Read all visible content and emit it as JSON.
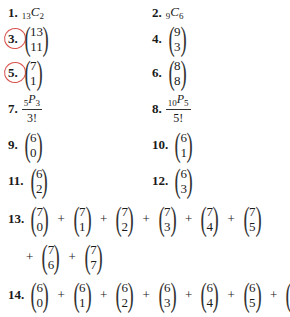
{
  "problems": [
    {
      "n": "1.",
      "type": "comb",
      "pre": "13",
      "letter": "C",
      "post": "2"
    },
    {
      "n": "2.",
      "type": "comb",
      "pre": "9",
      "letter": "C",
      "post": "6"
    },
    {
      "n": "3.",
      "type": "binom",
      "top": "13",
      "bot": "11",
      "circled": true
    },
    {
      "n": "4.",
      "type": "binom",
      "top": "9",
      "bot": "3"
    },
    {
      "n": "5.",
      "type": "binom",
      "top": "7",
      "bot": "1",
      "circled": true
    },
    {
      "n": "6.",
      "type": "binom",
      "top": "8",
      "bot": "8"
    },
    {
      "n": "7.",
      "type": "frac",
      "pre": "5",
      "letter": "P",
      "post": "3",
      "den": "3!"
    },
    {
      "n": "8.",
      "type": "frac",
      "pre": "10",
      "letter": "P",
      "post": "5",
      "den": "5!"
    },
    {
      "n": "9.",
      "type": "binom",
      "top": "6",
      "bot": "0"
    },
    {
      "n": "10.",
      "type": "binom",
      "top": "6",
      "bot": "1"
    },
    {
      "n": "11.",
      "type": "binom",
      "top": "6",
      "bot": "2"
    },
    {
      "n": "12.",
      "type": "binom",
      "top": "6",
      "bot": "3"
    },
    {
      "n": "13.",
      "type": "sum",
      "terms": [
        [
          "7",
          "0"
        ],
        [
          "7",
          "1"
        ],
        [
          "7",
          "2"
        ],
        [
          "7",
          "3"
        ],
        [
          "7",
          "4"
        ],
        [
          "7",
          "5"
        ],
        [
          "7",
          "6"
        ],
        [
          "7",
          "7"
        ]
      ]
    },
    {
      "n": "14.",
      "type": "sum",
      "terms": [
        [
          "6",
          "0"
        ],
        [
          "6",
          "1"
        ],
        [
          "6",
          "2"
        ],
        [
          "6",
          "3"
        ],
        [
          "6",
          "4"
        ],
        [
          "6",
          "5"
        ],
        [
          "6",
          "6"
        ]
      ]
    }
  ],
  "plus": "+",
  "annotation_color": "#d9534f"
}
